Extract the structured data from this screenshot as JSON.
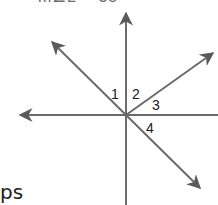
{
  "header": {
    "clipped_text": "m∠2 = 35"
  },
  "diagram": {
    "center": [
      126,
      115
    ],
    "line_color": "#6b6b6b",
    "rays": [
      {
        "name": "up",
        "end": [
          126,
          13
        ],
        "arrow": true
      },
      {
        "name": "down",
        "end": [
          126,
          205
        ],
        "arrow": false
      },
      {
        "name": "left",
        "end": [
          20,
          115
        ],
        "arrow": true
      },
      {
        "name": "right",
        "end": [
          218,
          115
        ],
        "arrow": false
      },
      {
        "name": "upper-left",
        "end": [
          52,
          42
        ],
        "arrow": true
      },
      {
        "name": "upper-right",
        "end": [
          213,
          53
        ],
        "arrow": true
      },
      {
        "name": "lower-right",
        "end": [
          200,
          188
        ],
        "arrow": true
      }
    ],
    "angle_labels": [
      {
        "text": "1",
        "x": 111,
        "y": 99
      },
      {
        "text": "2",
        "x": 132,
        "y": 99
      },
      {
        "text": "3",
        "x": 152,
        "y": 110
      },
      {
        "text": "4",
        "x": 146,
        "y": 133
      }
    ]
  },
  "footer": {
    "clipped_text": "ps"
  }
}
